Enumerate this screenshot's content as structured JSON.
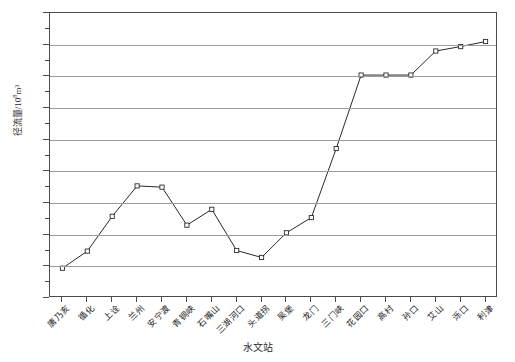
{
  "chart_data": {
    "type": "line",
    "title": "",
    "xlabel": "水文站",
    "ylabel": "径流量/10⁸m³",
    "ylabel_main": "径流量/10",
    "ylabel_exp": "8",
    "ylabel_unit": "m³",
    "ylim": [
      200,
      650
    ],
    "ytick_step": 50,
    "yticks": [
      200,
      250,
      300,
      350,
      400,
      450,
      500,
      550,
      600,
      650
    ],
    "ytick_labels": [
      "200",
      "250",
      "300",
      "350",
      "400",
      "450",
      "500",
      "550",
      "600",
      "650"
    ],
    "yminor_step": 25,
    "grid": true,
    "grid_axis": "y",
    "legend": "none",
    "marker": "open-square",
    "line_color": "#2a2a2a",
    "grid_color": "#9b9b9b",
    "axis_color": "#4a4a4a",
    "categories": [
      "唐乃亥",
      "循化",
      "上诠",
      "兰州",
      "安宁渡",
      "青铜峡",
      "石嘴山",
      "三湖河口",
      "头道拐",
      "吴堡",
      "龙门",
      "三门峡",
      "花园口",
      "高村",
      "孙口",
      "艾山",
      "泺口",
      "利津"
    ],
    "values": [
      247,
      274,
      329,
      377,
      375,
      315,
      340,
      275,
      264,
      303,
      327,
      436,
      552,
      552,
      552,
      590,
      597,
      605
    ],
    "series": [
      {
        "name": "径流量",
        "values": [
          247,
          274,
          329,
          377,
          375,
          315,
          340,
          275,
          264,
          303,
          327,
          436,
          552,
          552,
          552,
          590,
          597,
          605
        ]
      }
    ]
  }
}
